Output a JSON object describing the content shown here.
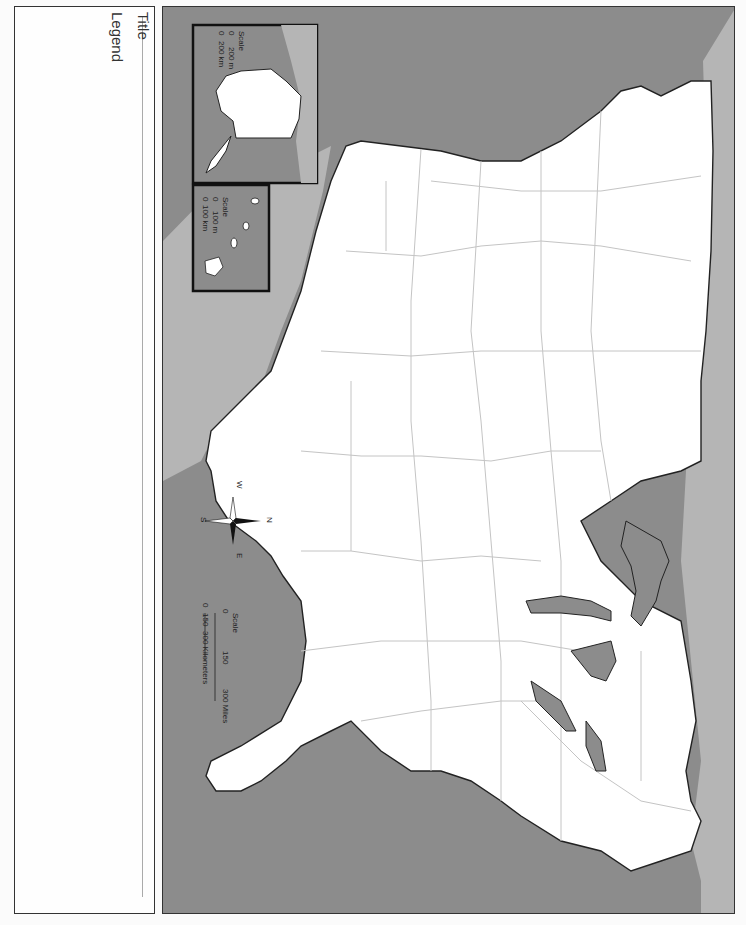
{
  "worksheet": {
    "title_label": "Title",
    "legend_label": "Legend"
  },
  "map": {
    "subject": "United States (rotated 90°, north to the right)",
    "colors": {
      "ocean": "#8c8c8c",
      "neighbor_land": "#b5b5b5",
      "us_land": "#ffffff",
      "lakes": "#8c8c8c",
      "border": "#222222",
      "state_lines": "#c4c4c4"
    },
    "compass": {
      "n": "N",
      "s": "S",
      "e": "E",
      "w": "W"
    },
    "scale_bar": {
      "label": "Scale",
      "miles": {
        "zero": "0",
        "mid": "150",
        "end": "300 Miles"
      },
      "km": {
        "zero": "0",
        "mid": "150",
        "end": "300 Kilometers"
      }
    },
    "insets": [
      {
        "name": "Alaska",
        "scale_label": "Scale",
        "miles": {
          "zero": "0",
          "end": "200 m"
        },
        "km": {
          "zero": "0",
          "end": "200 km"
        }
      },
      {
        "name": "Hawaii",
        "scale_label": "Scale",
        "miles": {
          "zero": "0",
          "end": "100 m"
        },
        "km": {
          "zero": "0",
          "end": "100 km"
        }
      }
    ]
  }
}
